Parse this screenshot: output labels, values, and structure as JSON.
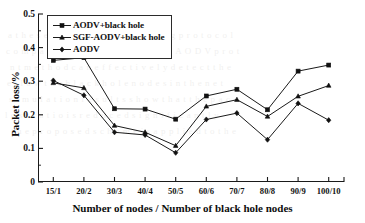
{
  "chart_data": {
    "type": "line",
    "title": "",
    "xlabel": "Number of nodes / Number of black hole nodes",
    "ylabel": "Packet loss/%",
    "categories": [
      "15/1",
      "20/2",
      "30/3",
      "40/4",
      "50/5",
      "60/6",
      "70/7",
      "80/8",
      "90/9",
      "100/10"
    ],
    "ylim": [
      0,
      0.5
    ],
    "yticks": [
      "0",
      "0.1",
      "0.2",
      "0.3",
      "0.4",
      "0.5"
    ],
    "ytick_values": [
      0,
      0.1,
      0.2,
      0.3,
      0.4,
      0.5
    ],
    "grid": false,
    "legend_position": "upper-left",
    "series": [
      {
        "name": "AODV+black hole",
        "marker": "square",
        "color": "#1a1a1a",
        "values": [
          0.362,
          0.37,
          0.218,
          0.217,
          0.187,
          0.256,
          0.276,
          0.215,
          0.33,
          0.348
        ]
      },
      {
        "name": "SGF-AODV+black hole",
        "marker": "triangle",
        "color": "#1a1a1a",
        "values": [
          0.295,
          0.28,
          0.168,
          0.148,
          0.108,
          0.225,
          0.245,
          0.195,
          0.255,
          0.287
        ]
      },
      {
        "name": "AODV",
        "marker": "diamond",
        "color": "#1a1a1a",
        "values": [
          0.302,
          0.258,
          0.148,
          0.14,
          0.087,
          0.186,
          0.205,
          0.126,
          0.234,
          0.184
        ]
      }
    ]
  },
  "background_text": {
    "lines": [
      "a  t  h  e   s  e  c  u  r  i  t  y   o  f   t  h  e   r  o  u  t  i  n  g   p  r  o  t  o  c  o  l",
      "c  o  m  p  a  r  e  d   w  i  t  h   t  h  e   o  r  i  g  i  n  a  l   A  O  D  V   p  r  o  t",
      "n  t   m  e  t  h  o  d   c  a  n   e  f  f  e  c  t  i  v  e  l  y   d  e  t  e  c  t   t  h  e",
      "e  l  l  o  w   t  h  e   b  l  a  c  k   h  o  l  e   n  o  d  e  s   i  n   t  h  e   n  e  t",
      "s  i  m  u  l  a  t  i  o  n   r  e  s  u  l  t  s   s  h  o  w   t  h  a  t   t  h  e   p  a  c",
      "l  o  s  s   r  a  t  i  o   i  s   r  e  d  u  c  e  d   s  i  g  n  i  f  i  c  a  n  t  l  y",
      "t  h  e   p  r  o  p  o  s  e  d   s  c  h  e  m  e   i  s   a  p  p  l  i  e  d   t  o   t  h  e"
    ]
  }
}
